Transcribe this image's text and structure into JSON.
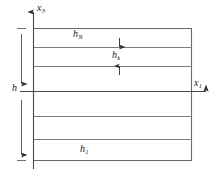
{
  "figure": {
    "kind": "layered-medium-diagram",
    "axes": {
      "vertical": {
        "name": "x3-axis",
        "label": "x",
        "subscript": "3",
        "direction": "up",
        "x": 33,
        "tip_y": 10,
        "base_y": 169
      },
      "horizontal": {
        "name": "x1-axis",
        "label": "x",
        "subscript": "1",
        "direction": "right",
        "y": 92,
        "start_x": 20,
        "tip_x": 210
      }
    },
    "body_rect": {
      "left": 33,
      "top": 28,
      "right": 192,
      "bottom": 161
    },
    "interfaces_y": [
      28,
      47,
      66,
      92,
      116,
      140,
      161
    ],
    "dimension": {
      "name": "total-thickness",
      "label": "h",
      "x": 22,
      "top_y": 28,
      "bottom_y": 161,
      "arrowheads": "both"
    },
    "layer_labels": [
      {
        "id": "h-N",
        "label": "h",
        "subscript": "N",
        "layer": "top"
      },
      {
        "id": "h-k",
        "label": "h",
        "subscript": "k",
        "layer": "second"
      },
      {
        "id": "h-1",
        "label": "h",
        "subscript": "1",
        "layer": "bottom"
      }
    ],
    "layer_thickness_arrows": {
      "name": "hk-thickness-arrows",
      "x": 119,
      "upper_arrow": {
        "from_y": 40,
        "to_y": 47,
        "direction": "down"
      },
      "lower_arrow": {
        "from_y": 73,
        "to_y": 66,
        "direction": "up"
      }
    },
    "colors": {
      "line": "#5a5a5a",
      "line_light": "#8a8a8a",
      "axis": "#3a3a3a",
      "text": "#1a1a1a",
      "background": "#ffffff"
    }
  }
}
